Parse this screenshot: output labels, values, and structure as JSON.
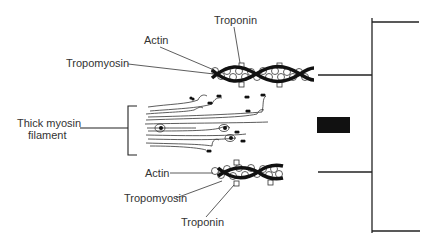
{
  "diagram": {
    "type": "sarcomere-thin-thick-filament",
    "labels": {
      "top_troponin": "Troponin",
      "top_actin": "Actin",
      "top_tropomyosin": "Tropomyosin",
      "myosin_line1": "Thick myosin",
      "myosin_line2": "filament",
      "bottom_actin": "Actin",
      "bottom_tropomyosin": "Tropomyosin",
      "bottom_troponin": "Troponin"
    },
    "colors": {
      "line": "#222222",
      "text": "#333333",
      "fill_dark": "#111111",
      "background": "#ffffff"
    }
  }
}
